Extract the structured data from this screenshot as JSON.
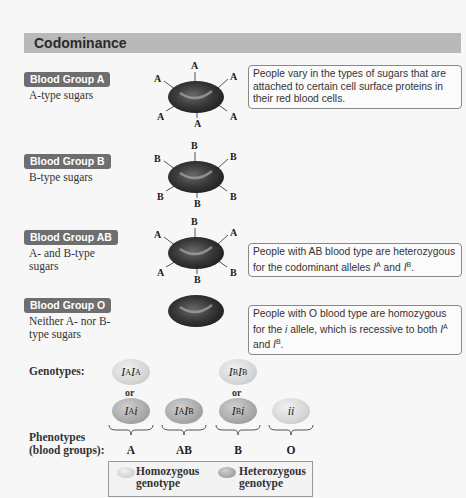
{
  "title": "Codominance",
  "groups": [
    {
      "badge": "Blood Group A",
      "desc": "A-type sugars",
      "sugars": [
        "A",
        "A",
        "A",
        "A",
        "A",
        "A"
      ],
      "info": "People vary in the types of sugars that are attached to certain cell surface proteins in their red blood cells."
    },
    {
      "badge": "Blood Group B",
      "desc": "B-type sugars",
      "sugars": [
        "B",
        "B",
        "B",
        "B",
        "B",
        "B"
      ]
    },
    {
      "badge": "Blood Group AB",
      "desc": "A- and B-type sugars",
      "sugars": [
        "B",
        "A",
        "A",
        "A",
        "B",
        "B"
      ],
      "info_pre": "People with AB blood type are heterozygous for the codominant alleles ",
      "info_a": "I",
      "info_a_sup": "A",
      "info_and": " and ",
      "info_b": "I",
      "info_b_sup": "B",
      "info_end": "."
    },
    {
      "badge": "Blood Group O",
      "desc": "Neither A- nor B-type sugars",
      "sugars": [],
      "info_pre": "People with O blood type are homozygous for the ",
      "info_i": "i",
      "info_mid": " allele, which is recessive to both ",
      "info_a": "I",
      "info_a_sup": "A",
      "info_and": " and ",
      "info_b": "I",
      "info_b_sup": "B",
      "info_end": "."
    }
  ],
  "genotypes_label": "Genotypes:",
  "phenotypes_label": "Phenotypes (blood groups):",
  "or_label": "or",
  "genotypes": {
    "AA": {
      "base1": "I",
      "sup1": "A",
      "base2": "I",
      "sup2": "A",
      "type": "homozygous"
    },
    "Ai": {
      "base1": "I",
      "sup1": "A",
      "base2": "i",
      "type": "heterozygous"
    },
    "AB": {
      "base1": "I",
      "sup1": "A",
      "base2": "I",
      "sup2": "B",
      "type": "heterozygous"
    },
    "BB": {
      "base1": "I",
      "sup1": "B",
      "base2": "I",
      "sup2": "B",
      "type": "homozygous"
    },
    "Bi": {
      "base1": "I",
      "sup1": "B",
      "base2": "i",
      "type": "heterozygous"
    },
    "ii": {
      "text": "ii",
      "type": "homozygous"
    }
  },
  "phenotypes": [
    "A",
    "AB",
    "B",
    "O"
  ],
  "legend": {
    "homozygous": "Homozygous genotype",
    "homozygous_l1": "Homozygous",
    "homozygous_l2": "genotype",
    "heterozygous_l1": "Heterozygous",
    "heterozygous_l2": "genotype"
  },
  "colors": {
    "title_bar": "#b9b9b9",
    "badge": "#6e6e6e",
    "cell_dark": "#2e2e2e",
    "homozygous": "#d6d6d6",
    "heterozygous": "#a8a8a8"
  }
}
